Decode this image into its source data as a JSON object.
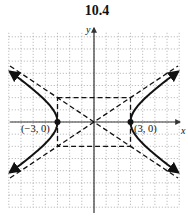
{
  "title": "10.4",
  "graph": {
    "x_axis_label": "x",
    "y_axis_label": "y",
    "grid_range": {
      "xmin": -7,
      "xmax": 7,
      "ymin": -7,
      "ymax": 7
    },
    "equation": "x^2/9 - y^2/4 = 1",
    "vertices": [
      {
        "label": "(−3, 0)",
        "x": -3,
        "y": 0
      },
      {
        "label": "(3, 0)",
        "x": 3,
        "y": 0
      }
    ],
    "asymptotes": [
      "y = (2/3)x",
      "y = -(2/3)x"
    ],
    "central_box": {
      "x": [
        -3,
        3
      ],
      "y": [
        -2,
        2
      ]
    },
    "colors": {
      "curve": "#111111",
      "grid": "#9a9a9a",
      "axis": "#333333"
    }
  }
}
